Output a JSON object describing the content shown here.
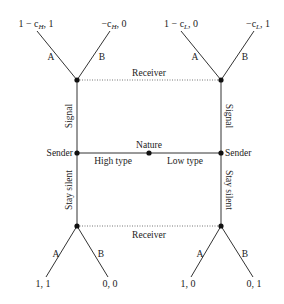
{
  "diagram": {
    "type": "signaling game tree",
    "nature": {
      "label": "Nature",
      "branches": {
        "left": "High type",
        "right": "Low type"
      }
    },
    "senders": {
      "left": {
        "label": "Sender",
        "up_action": "Signal",
        "down_action": "Stay silent"
      },
      "right": {
        "label": "Sender",
        "up_action": "Signal",
        "down_action": "Stay silent"
      }
    },
    "receivers": {
      "top": {
        "label": "Receiver",
        "actions": [
          "A",
          "B"
        ]
      },
      "bottom": {
        "label": "Receiver",
        "actions": [
          "A",
          "B"
        ]
      }
    },
    "payoffs": {
      "top_left_A": "1 − c",
      "top_left_A_sub": "H",
      "top_left_A_tail": ", 1",
      "top_left_B": "−c",
      "top_left_B_sub": "H",
      "top_left_B_tail": ", 0",
      "top_right_A": "1 − c",
      "top_right_A_sub": "L",
      "top_right_A_tail": ", 0",
      "top_right_B": "−c",
      "top_right_B_sub": "L",
      "top_right_B_tail": ", 1",
      "bottom_left_A": "1, 1",
      "bottom_left_B": "0, 0",
      "bottom_right_A": "1, 0",
      "bottom_right_B": "0, 1"
    },
    "edge_labels": {
      "A": "A",
      "B": "B"
    }
  }
}
